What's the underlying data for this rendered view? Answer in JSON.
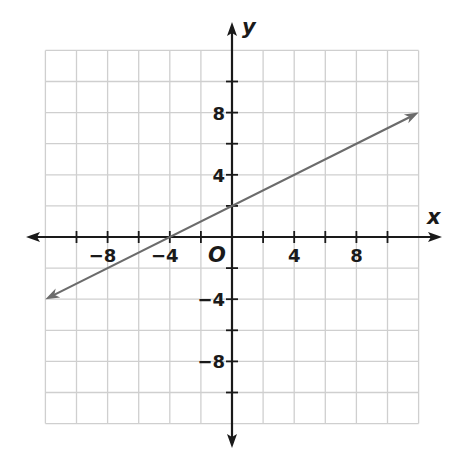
{
  "chart_data": {
    "type": "line",
    "title": "",
    "xlabel": "x",
    "ylabel": "y",
    "origin_label": "O",
    "xlim": [
      -12,
      12
    ],
    "ylim": [
      -12,
      12
    ],
    "grid": true,
    "grid_step": 2,
    "x_tick_labels": [
      {
        "value": -8,
        "label": "−8"
      },
      {
        "value": -4,
        "label": "−4"
      },
      {
        "value": 4,
        "label": "4"
      },
      {
        "value": 8,
        "label": "8"
      }
    ],
    "y_tick_labels": [
      {
        "value": 8,
        "label": "8"
      },
      {
        "value": 4,
        "label": "4"
      },
      {
        "value": -4,
        "label": "−4"
      },
      {
        "value": -8,
        "label": "−8"
      }
    ],
    "series": [
      {
        "name": "line",
        "equation": "y = 0.5x + 2",
        "x": [
          -12,
          -4,
          0,
          4,
          12
        ],
        "y": [
          -4,
          0,
          2,
          4,
          8
        ],
        "arrows_both_ends": true,
        "color": "#6b6b6b"
      }
    ],
    "legend": null
  },
  "colors": {
    "grid": "#cfcfcf",
    "axis": "#1a1a1a",
    "line": "#6b6b6b"
  }
}
